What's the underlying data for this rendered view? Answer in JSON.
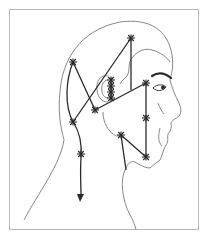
{
  "figure": {
    "title": "Head and neck trigger point referral diagram",
    "colors": {
      "background": "#ffffff",
      "border": "#b8b8b8",
      "outline": "#6a6a6a",
      "pathways": "#2a2a2a"
    },
    "elements": {
      "head_outline": "head-profile-outline",
      "markers": "asterisk-markers",
      "arrow": "downward-arrow"
    },
    "marker_count": 14
  }
}
